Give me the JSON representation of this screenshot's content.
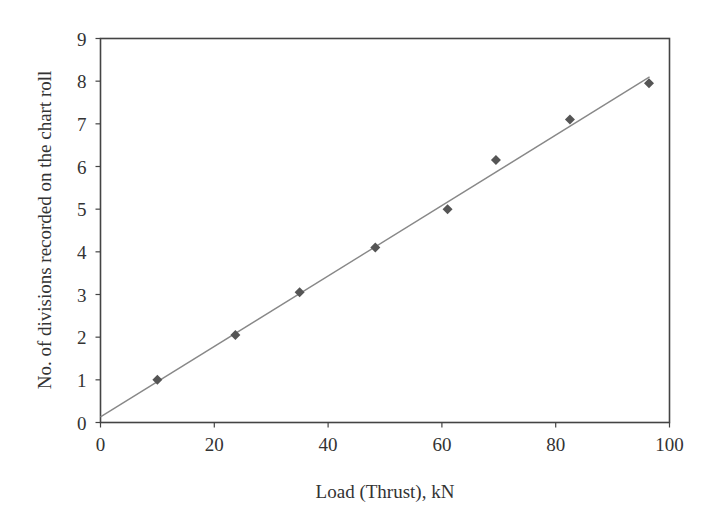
{
  "chart_data": {
    "type": "scatter",
    "title": "",
    "xlabel": "Load (Thrust), kN",
    "ylabel": "No. of divisions recorded on the chart roll",
    "xlim": [
      0,
      100
    ],
    "ylim": [
      0,
      9
    ],
    "x_ticks": [
      0,
      20,
      40,
      60,
      80,
      100
    ],
    "y_ticks": [
      0,
      1,
      2,
      3,
      4,
      5,
      6,
      7,
      8,
      9
    ],
    "grid": false,
    "legend": null,
    "series": [
      {
        "name": "Measured",
        "marker": "diamond",
        "color": "#555555",
        "x": [
          10.0,
          23.7,
          35.0,
          48.3,
          61.0,
          69.5,
          82.5,
          96.4
        ],
        "y": [
          1.0,
          2.05,
          3.05,
          4.1,
          5.0,
          6.15,
          7.1,
          7.95
        ]
      }
    ],
    "trendline": {
      "type": "linear",
      "color": "#888888",
      "x": [
        0,
        96.5
      ],
      "y": [
        0.13,
        8.1
      ]
    }
  },
  "colors": {
    "axis": "#444444",
    "marker": "#555555",
    "line": "#888888",
    "text": "#333333"
  }
}
